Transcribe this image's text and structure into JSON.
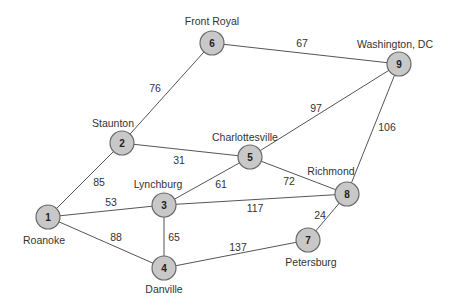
{
  "graph": {
    "nodes": [
      {
        "id": "1",
        "city": "Roanoke",
        "x": 48,
        "y": 217,
        "lx": 44,
        "ly": 244
      },
      {
        "id": "2",
        "city": "Staunton",
        "x": 122,
        "y": 143,
        "lx": 113,
        "ly": 127
      },
      {
        "id": "3",
        "city": "Lynchburg",
        "x": 164,
        "y": 205,
        "lx": 158,
        "ly": 188
      },
      {
        "id": "4",
        "city": "Danville",
        "x": 164,
        "y": 268,
        "lx": 164,
        "ly": 293
      },
      {
        "id": "5",
        "city": "Charlottesville",
        "x": 250,
        "y": 157,
        "lx": 245,
        "ly": 141
      },
      {
        "id": "6",
        "city": "Front Royal",
        "x": 212,
        "y": 43,
        "lx": 212,
        "ly": 25
      },
      {
        "id": "7",
        "city": "Petersburg",
        "x": 308,
        "y": 240,
        "lx": 311,
        "ly": 266
      },
      {
        "id": "8",
        "city": "Richmond",
        "x": 347,
        "y": 194,
        "lx": 331,
        "ly": 175
      },
      {
        "id": "9",
        "city": "Washington, DC",
        "x": 399,
        "y": 64,
        "lx": 395,
        "ly": 48
      }
    ],
    "edges": [
      {
        "from": "1",
        "to": "2",
        "weight": "85",
        "wx": 99,
        "wy": 186
      },
      {
        "from": "1",
        "to": "3",
        "weight": "53",
        "wx": 111,
        "wy": 206
      },
      {
        "from": "1",
        "to": "4",
        "weight": "88",
        "wx": 116,
        "wy": 241
      },
      {
        "from": "2",
        "to": "6",
        "weight": "76",
        "wx": 155,
        "wy": 92
      },
      {
        "from": "2",
        "to": "5",
        "weight": "31",
        "wx": 179,
        "wy": 164
      },
      {
        "from": "3",
        "to": "5",
        "weight": "61",
        "wx": 221,
        "wy": 188
      },
      {
        "from": "3",
        "to": "8",
        "weight": "117",
        "wx": 255,
        "wy": 212
      },
      {
        "from": "3",
        "to": "4",
        "weight": "65",
        "wx": 174,
        "wy": 241
      },
      {
        "from": "5",
        "to": "8",
        "weight": "72",
        "wx": 289,
        "wy": 185
      },
      {
        "from": "5",
        "to": "9",
        "weight": "97",
        "wx": 316,
        "wy": 112
      },
      {
        "from": "6",
        "to": "9",
        "weight": "67",
        "wx": 302,
        "wy": 47
      },
      {
        "from": "9",
        "to": "8",
        "weight": "106",
        "wx": 387,
        "wy": 131
      },
      {
        "from": "8",
        "to": "7",
        "weight": "24",
        "wx": 320,
        "wy": 219
      },
      {
        "from": "4",
        "to": "7",
        "weight": "137",
        "wx": 238,
        "wy": 251
      }
    ]
  },
  "colors": {
    "node_fill": "#c8c8c8",
    "node_stroke": "#6a6a6a",
    "edge": "#555555",
    "text": "#333333"
  }
}
